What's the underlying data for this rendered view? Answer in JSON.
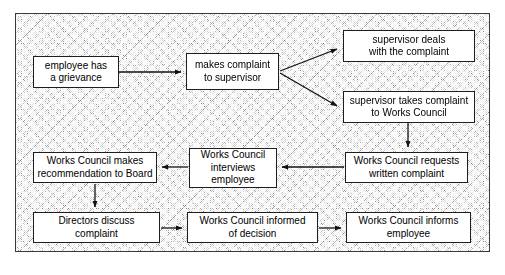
{
  "diagram": {
    "background_color": "#b9b9b9",
    "node_fill": "#ffffff",
    "node_border": "#1e1e1e",
    "edge_color": "#111111",
    "nodes": [
      {
        "id": "employee-grievance",
        "label": "employee has\na grievance",
        "line1": "employee has",
        "line2": "a grievance",
        "line3": "",
        "x": 33,
        "y": 56,
        "w": 86,
        "h": 32
      },
      {
        "id": "makes-complaint",
        "label": "makes complaint\nto supervisor",
        "line1": "makes complaint",
        "line2": "to supervisor",
        "line3": "",
        "x": 186,
        "y": 53,
        "w": 93,
        "h": 37
      },
      {
        "id": "supervisor-deals",
        "label": "supervisor deals\nwith the complaint",
        "line1": "supervisor deals",
        "line2": "with the complaint",
        "line3": "",
        "x": 343,
        "y": 30,
        "w": 132,
        "h": 32
      },
      {
        "id": "supervisor-takes",
        "label": "supervisor takes complaint\nto Works Council",
        "line1": "supervisor takes complaint",
        "line2": "to Works Council",
        "line3": "",
        "x": 343,
        "y": 91,
        "w": 132,
        "h": 32
      },
      {
        "id": "wc-requests",
        "label": "Works Council requests\nwritten complaint",
        "line1": "Works Council requests",
        "line2": "written complaint",
        "line3": "",
        "x": 345,
        "y": 152,
        "w": 123,
        "h": 31
      },
      {
        "id": "wc-interviews",
        "label": "Works Council\ninterviews\nemployee",
        "line1": "Works Council",
        "line2": "interviews",
        "line3": "employee",
        "x": 189,
        "y": 148,
        "w": 88,
        "h": 40
      },
      {
        "id": "wc-recommendation",
        "label": "Works Council makes\nrecommendation to Board",
        "line1": "Works Council makes",
        "line2": "recommendation to Board",
        "line3": "",
        "x": 33,
        "y": 152,
        "w": 124,
        "h": 31
      },
      {
        "id": "directors-discuss",
        "label": "Directors discuss\ncomplaint",
        "line1": "Directors discuss",
        "line2": "complaint",
        "line3": "",
        "x": 33,
        "y": 212,
        "w": 127,
        "h": 31
      },
      {
        "id": "wc-informed",
        "label": "Works Council informed\nof decision",
        "line1": "Works Council informed",
        "line2": "of decision",
        "line3": "",
        "x": 187,
        "y": 212,
        "w": 131,
        "h": 31
      },
      {
        "id": "wc-informs-employee",
        "label": "Works Council informs\nemployee",
        "line1": "Works Council informs",
        "line2": "employee",
        "line3": "",
        "x": 346,
        "y": 212,
        "w": 125,
        "h": 31
      }
    ],
    "edges": [
      {
        "id": "edge-grievance-to-complaint",
        "from": "employee-grievance",
        "to": "makes-complaint",
        "direction": "right"
      },
      {
        "id": "edge-complaint-to-deals",
        "from": "makes-complaint",
        "to": "supervisor-deals",
        "direction": "up-right"
      },
      {
        "id": "edge-complaint-to-takes",
        "from": "makes-complaint",
        "to": "supervisor-takes",
        "direction": "down-right"
      },
      {
        "id": "edge-takes-to-requests",
        "from": "supervisor-takes",
        "to": "wc-requests",
        "direction": "down"
      },
      {
        "id": "edge-requests-to-interviews",
        "from": "wc-requests",
        "to": "wc-interviews",
        "direction": "left"
      },
      {
        "id": "edge-interviews-to-recommendation",
        "from": "wc-interviews",
        "to": "wc-recommendation",
        "direction": "left"
      },
      {
        "id": "edge-recommendation-to-directors",
        "from": "wc-recommendation",
        "to": "directors-discuss",
        "direction": "down"
      },
      {
        "id": "edge-directors-to-informed",
        "from": "directors-discuss",
        "to": "wc-informed",
        "direction": "right"
      },
      {
        "id": "edge-informed-to-informs",
        "from": "wc-informed",
        "to": "wc-informs-employee",
        "direction": "right"
      }
    ]
  }
}
